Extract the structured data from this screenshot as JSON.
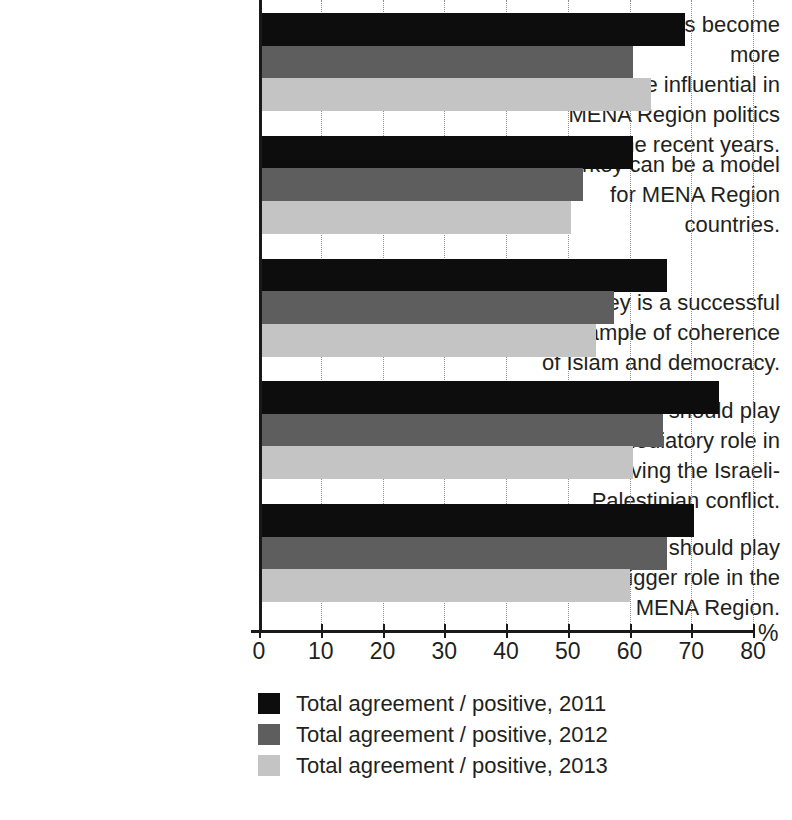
{
  "chart_data": {
    "type": "bar",
    "orientation": "horizontal",
    "title": "",
    "subtitle": "",
    "xlabel": "%",
    "ylabel": "",
    "xlim": [
      0,
      80
    ],
    "grid": true,
    "grid_axis": "x",
    "legend_position": "bottom",
    "categories": [
      "Turkey has become more and more influential in MENA Region politics in the recent years.",
      "Turkey can be a model for MENA Region countries.",
      "Turkey is a successful example of coherence of Islam and democracy.",
      "Turkey should play a mediatory role in resolving the Israeli-Palestinian conflict.",
      "Turkey should play a bigger role in the MENA Region."
    ],
    "category_lines": [
      [
        "Turkey has become more",
        "and more influential in",
        "MENA Region politics",
        "in the recent years."
      ],
      [
        "Turkey can be a model",
        "for MENA Region",
        "countries."
      ],
      [
        "Turkey is a successful",
        "example of coherence",
        "of Islam and democracy."
      ],
      [
        "Turkey should play",
        "a mediatory role in",
        "resolving the Israeli-",
        "Palestinian conflict."
      ],
      [
        "Turkey should play",
        "a bigger role in the",
        "MENA Region."
      ]
    ],
    "series": [
      {
        "name": "Total agreement / positive, 2011",
        "color": "#0d0d0d",
        "values": [
          69,
          60.5,
          66,
          74.5,
          70.5
        ]
      },
      {
        "name": "Total agreement / positive, 2012",
        "color": "#5e5e5e",
        "values": [
          60.5,
          52.5,
          57.5,
          65.5,
          66
        ]
      },
      {
        "name": "Total agreement / positive, 2013",
        "color": "#c4c4c4",
        "values": [
          63.5,
          50.5,
          54.5,
          60.5,
          60
        ]
      }
    ],
    "xticks": [
      0,
      10,
      20,
      30,
      40,
      50,
      60,
      70,
      80
    ],
    "xtick_labels": [
      "0",
      "10",
      "20",
      "30",
      "40",
      "50",
      "60",
      "70",
      "80"
    ]
  },
  "axis": {
    "unit_label": "%"
  },
  "legend": {
    "items": [
      {
        "label": "Total agreement / positive, 2011",
        "swatch": "s2011"
      },
      {
        "label": "Total agreement / positive, 2012",
        "swatch": "s2012"
      },
      {
        "label": "Total agreement / positive, 2013",
        "swatch": "s2013"
      }
    ]
  }
}
